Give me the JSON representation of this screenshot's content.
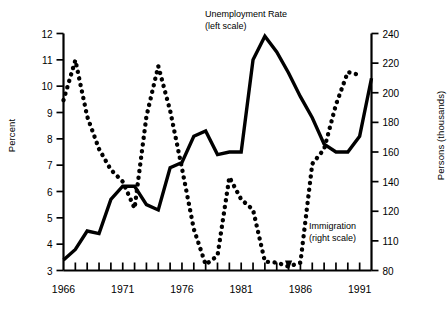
{
  "chart_data": {
    "type": "line",
    "title": "",
    "xlabel": "",
    "ylabel": "Percent",
    "ylabel_right": "Persons (thousands)",
    "grid": false,
    "legend_position": "inline-annotations",
    "x": [
      1966,
      1967,
      1968,
      1969,
      1970,
      1971,
      1972,
      1973,
      1974,
      1975,
      1976,
      1977,
      1978,
      1979,
      1980,
      1981,
      1982,
      1983,
      1984,
      1985,
      1986,
      1987,
      1988,
      1989,
      1990,
      1991,
      1992
    ],
    "xlim": [
      1966,
      1992
    ],
    "xticks": [
      1966,
      1967,
      1968,
      1969,
      1970,
      1971,
      1972,
      1973,
      1974,
      1975,
      1976,
      1977,
      1978,
      1979,
      1980,
      1981,
      1982,
      1983,
      1984,
      1985,
      1986,
      1987,
      1988,
      1989,
      1990,
      1991,
      1992
    ],
    "xtick_labels": [
      "1966",
      "",
      "",
      "",
      "",
      "1971",
      "",
      "",
      "",
      "",
      "1976",
      "",
      "",
      "",
      "",
      "1981",
      "",
      "",
      "",
      "",
      "1986",
      "",
      "",
      "",
      "",
      "1991",
      ""
    ],
    "yticks_left": [
      3,
      4,
      5,
      6,
      7,
      8,
      9,
      10,
      11,
      12
    ],
    "ylim_left": [
      3,
      12
    ],
    "yticks_right": [
      80,
      110,
      120,
      140,
      160,
      180,
      200,
      220,
      240
    ],
    "ylim_right": [
      80,
      240
    ],
    "series": [
      {
        "name": "Unemployment Rate",
        "scale": "left",
        "style": "solid",
        "annotation": "Unemployment Rate",
        "annotation_sub": "(left scale)",
        "units": "Percent",
        "values": [
          3.4,
          3.8,
          4.5,
          4.4,
          5.7,
          6.2,
          6.2,
          5.5,
          5.3,
          6.9,
          7.1,
          8.1,
          8.3,
          7.4,
          7.5,
          7.5,
          11.0,
          11.9,
          11.3,
          10.5,
          9.6,
          8.8,
          7.8,
          7.5,
          7.5,
          8.1,
          10.3
        ]
      },
      {
        "name": "Immigration",
        "scale": "right",
        "style": "dotted",
        "annotation": "Immigration",
        "annotation_sub": "(right scale)",
        "units": "Persons (thousands)",
        "values": [
          195,
          222,
          184,
          162,
          148,
          140,
          122,
          184,
          218,
          188,
          149,
          114,
          86,
          95,
          143,
          128,
          121,
          89,
          88,
          84,
          88,
          152,
          162,
          192,
          214,
          212,
          null
        ]
      }
    ],
    "annotations": [
      {
        "text": "Unemployment Rate",
        "sub": "(left scale)"
      },
      {
        "text": "Immigration",
        "sub": "(right scale)"
      }
    ],
    "colors": {
      "series": "#000000",
      "axis": "#000000",
      "background": "#ffffff"
    }
  }
}
